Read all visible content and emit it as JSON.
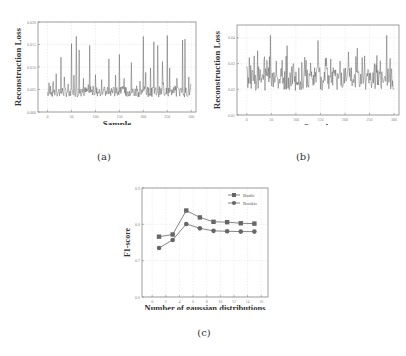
{
  "captions": {
    "a": "(a)",
    "b": "(b)",
    "c": "(c)"
  },
  "chart_data": [
    {
      "id": "a",
      "type": "line",
      "title": "",
      "xlabel": "Sample",
      "ylabel": "Reconstruction Loss",
      "xlim": [
        -20,
        310
      ],
      "ylim": [
        0.0,
        0.02
      ],
      "xticks": [
        0,
        50,
        100,
        150,
        200,
        250,
        300
      ],
      "yticks": [
        0.0,
        0.005,
        0.01,
        0.015,
        0.02
      ],
      "ytick_labels": [
        "0.000",
        "0.005",
        "0.010",
        "0.015",
        "0.020"
      ],
      "grid": true,
      "color": "#555555",
      "n_points": 300,
      "baseline": 0.0045,
      "noise": 0.0012,
      "spikes": [
        [
          3,
          0.0065
        ],
        [
          12,
          0.0068
        ],
        [
          18,
          0.0085
        ],
        [
          28,
          0.0122
        ],
        [
          35,
          0.0078
        ],
        [
          50,
          0.0152
        ],
        [
          55,
          0.0082
        ],
        [
          60,
          0.0168
        ],
        [
          66,
          0.0138
        ],
        [
          75,
          0.0075
        ],
        [
          88,
          0.0148
        ],
        [
          100,
          0.0083
        ],
        [
          113,
          0.0072
        ],
        [
          128,
          0.0118
        ],
        [
          142,
          0.0082
        ],
        [
          150,
          0.0128
        ],
        [
          160,
          0.0075
        ],
        [
          175,
          0.011
        ],
        [
          200,
          0.0168
        ],
        [
          205,
          0.0088
        ],
        [
          215,
          0.0098
        ],
        [
          222,
          0.0156
        ],
        [
          230,
          0.0148
        ],
        [
          240,
          0.0112
        ],
        [
          250,
          0.017
        ],
        [
          255,
          0.0098
        ],
        [
          270,
          0.0075
        ],
        [
          282,
          0.016
        ],
        [
          287,
          0.0162
        ],
        [
          295,
          0.0078
        ]
      ]
    },
    {
      "id": "b",
      "type": "line",
      "title": "",
      "xlabel": "Sample",
      "ylabel": "Reconstruction Loss",
      "xlim": [
        -20,
        310
      ],
      "ylim": [
        0.01,
        0.045
      ],
      "xticks": [
        0,
        50,
        100,
        150,
        200,
        250,
        300
      ],
      "yticks": [
        0.01,
        0.02,
        0.03,
        0.04
      ],
      "ytick_labels": [
        "0.01",
        "0.02",
        "0.03",
        "0.04"
      ],
      "grid": true,
      "color": "#555555",
      "n_points": 300,
      "baseline": 0.024,
      "noise": 0.0045,
      "spikes": [
        [
          0,
          0.029
        ],
        [
          15,
          0.033
        ],
        [
          22,
          0.035
        ],
        [
          48,
          0.041
        ],
        [
          60,
          0.031
        ],
        [
          82,
          0.037
        ],
        [
          95,
          0.03
        ],
        [
          120,
          0.029
        ],
        [
          145,
          0.039
        ],
        [
          160,
          0.032
        ],
        [
          190,
          0.031
        ],
        [
          225,
          0.036
        ],
        [
          240,
          0.033
        ],
        [
          260,
          0.03
        ],
        [
          285,
          0.041
        ],
        [
          292,
          0.032
        ]
      ]
    },
    {
      "id": "c",
      "type": "line",
      "title": "",
      "xlabel": "Number of gaussian distributions",
      "ylabel": "F1-score",
      "xlim": [
        -1.5,
        17
      ],
      "ylim": [
        0.6,
        0.9
      ],
      "xticks": [
        0,
        2,
        4,
        6,
        8,
        10,
        12,
        14,
        16
      ],
      "yticks": [
        0.6,
        0.7,
        0.8,
        0.9
      ],
      "ytick_labels": [
        "0.6",
        "0.7",
        "0.8",
        "0.9"
      ],
      "grid": true,
      "legend_position": "upper right",
      "x": [
        1,
        3,
        5,
        7,
        9,
        11,
        13,
        15
      ],
      "series": [
        {
          "name": "Battle",
          "marker": "square",
          "color": "#666666",
          "values": [
            0.766,
            0.772,
            0.838,
            0.819,
            0.807,
            0.806,
            0.803,
            0.802
          ]
        },
        {
          "name": "Rookie",
          "marker": "circle",
          "color": "#666666",
          "values": [
            0.735,
            0.757,
            0.801,
            0.789,
            0.782,
            0.781,
            0.78,
            0.78
          ]
        }
      ]
    }
  ]
}
